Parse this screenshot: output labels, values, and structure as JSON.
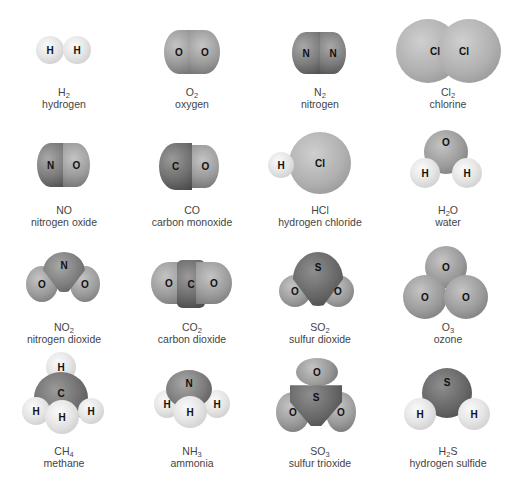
{
  "molecules": [
    {
      "formula": "H",
      "sub": "2",
      "tail": "",
      "name": "hydrogen",
      "atoms": [
        "H",
        "H"
      ]
    },
    {
      "formula": "O",
      "sub": "2",
      "tail": "",
      "name": "oxygen",
      "atoms": [
        "O",
        "O"
      ]
    },
    {
      "formula": "N",
      "sub": "2",
      "tail": "",
      "name": "nitrogen",
      "atoms": [
        "N",
        "N"
      ]
    },
    {
      "formula": "Cl",
      "sub": "2",
      "tail": "",
      "name": "chlorine",
      "atoms": [
        "Cl",
        "Cl"
      ]
    },
    {
      "formula": "NO",
      "sub": "",
      "tail": "",
      "name": "nitrogen oxide",
      "atoms": [
        "N",
        "O"
      ]
    },
    {
      "formula": "CO",
      "sub": "",
      "tail": "",
      "name": "carbon monoxide",
      "atoms": [
        "C",
        "O"
      ]
    },
    {
      "formula": "HCl",
      "sub": "",
      "tail": "",
      "name": "hydrogen chloride",
      "atoms": [
        "H",
        "Cl"
      ]
    },
    {
      "formula": "H",
      "sub": "2",
      "tail": "O",
      "name": "water",
      "atoms": [
        "O",
        "H",
        "H"
      ]
    },
    {
      "formula": "NO",
      "sub": "2",
      "tail": "",
      "name": "nitrogen dioxide",
      "atoms": [
        "N",
        "O",
        "O"
      ]
    },
    {
      "formula": "CO",
      "sub": "2",
      "tail": "",
      "name": "carbon dioxide",
      "atoms": [
        "O",
        "C",
        "O"
      ]
    },
    {
      "formula": "SO",
      "sub": "2",
      "tail": "",
      "name": "sulfur dioxide",
      "atoms": [
        "S",
        "O",
        "O"
      ]
    },
    {
      "formula": "O",
      "sub": "3",
      "tail": "",
      "name": "ozone",
      "atoms": [
        "O",
        "O",
        "O"
      ]
    },
    {
      "formula": "CH",
      "sub": "4",
      "tail": "",
      "name": "methane",
      "atoms": [
        "H",
        "C",
        "H",
        "H",
        "H"
      ]
    },
    {
      "formula": "NH",
      "sub": "3",
      "tail": "",
      "name": "ammonia",
      "atoms": [
        "N",
        "H",
        "H",
        "H"
      ]
    },
    {
      "formula": "SO",
      "sub": "3",
      "tail": "",
      "name": "sulfur trioxide",
      "atoms": [
        "O",
        "S",
        "O",
        "O"
      ]
    },
    {
      "formula": "H",
      "sub": "2",
      "tail": "S",
      "name": "hydrogen sulfide",
      "atoms": [
        "S",
        "H",
        "H"
      ]
    }
  ]
}
